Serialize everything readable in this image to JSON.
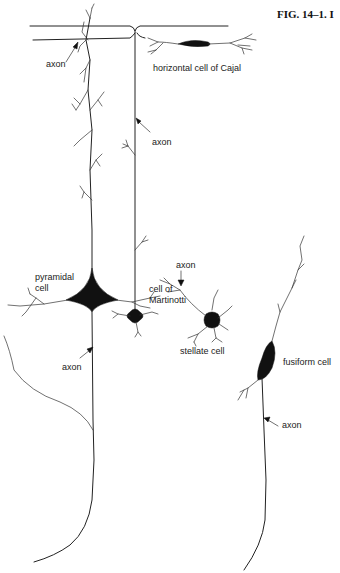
{
  "figure": {
    "title": "FIG. 14–1. I",
    "labels": {
      "axon_top": "axon",
      "horizontal_cell": "horizontal cell of Cajal",
      "axon_martinotti": "axon",
      "martinotti_line1": "cell of",
      "martinotti_line2": "Martinotti",
      "axon_stellate": "axon",
      "pyramidal_line1": "pyramidal",
      "pyramidal_line2": "cell",
      "stellate_cell": "stellate cell",
      "axon_pyramidal": "axon",
      "fusiform_cell": "fusiform cell",
      "axon_fusiform": "axon"
    },
    "cells": [
      {
        "name": "horizontal cell of Cajal",
        "shape": "elongated"
      },
      {
        "name": "cell of Martinotti",
        "shape": "multipolar"
      },
      {
        "name": "pyramidal cell",
        "shape": "pyramidal"
      },
      {
        "name": "stellate cell",
        "shape": "star"
      },
      {
        "name": "fusiform cell",
        "shape": "spindle"
      }
    ],
    "colors": {
      "ink": "#111111",
      "background": "#ffffff"
    }
  }
}
